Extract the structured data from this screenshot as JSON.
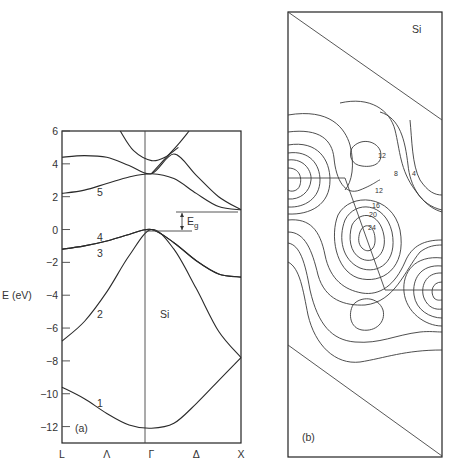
{
  "chart_data": [
    {
      "type": "line",
      "panel_label": "(a)",
      "title": "",
      "material_label": "Si",
      "ylabel": "E (eV)",
      "xlabel": "",
      "ylim": [
        -13,
        6
      ],
      "yticks": [
        6,
        4,
        2,
        0,
        -2,
        -4,
        -6,
        -8,
        -10,
        -12
      ],
      "ytick_labels": [
        "6",
        "4",
        "2",
        "0",
        "−2",
        "−4",
        "−6",
        "−8",
        "−10",
        "−12"
      ],
      "xtick_labels": [
        "L",
        "Λ",
        "Γ",
        "Δ",
        "X"
      ],
      "x_points": [
        0,
        0.5,
        1,
        1.5,
        2
      ],
      "gap_annotation": "E",
      "gap_annotation_sub": "g",
      "band_labels": [
        "1",
        "2",
        "3",
        "4",
        "5"
      ],
      "series": [
        {
          "name": "band 1",
          "x": [
            0,
            0.25,
            0.5,
            0.75,
            1,
            1.25,
            1.5,
            1.75,
            2
          ],
          "values": [
            -9.6,
            -10.3,
            -11.2,
            -11.9,
            -12.1,
            -11.8,
            -10.6,
            -9.2,
            -7.8
          ]
        },
        {
          "name": "band 2",
          "x": [
            0,
            0.25,
            0.5,
            0.75,
            1,
            1.25,
            1.5,
            1.75,
            2
          ],
          "values": [
            -6.8,
            -5.6,
            -3.8,
            -1.6,
            0,
            -1.2,
            -3.6,
            -6.2,
            -7.8
          ]
        },
        {
          "name": "band 3",
          "x": [
            0,
            0.25,
            0.5,
            0.75,
            1,
            1.25,
            1.5,
            1.75,
            2
          ],
          "values": [
            -1.2,
            -1.0,
            -0.7,
            -0.3,
            0,
            -0.8,
            -1.9,
            -2.7,
            -2.9
          ]
        },
        {
          "name": "band 4",
          "x": [
            0,
            0.25,
            0.5,
            0.75,
            1,
            1.25,
            1.5,
            1.75,
            2
          ],
          "values": [
            -1.2,
            -1.0,
            -0.7,
            -0.3,
            0,
            -0.8,
            -1.9,
            -2.7,
            -2.9
          ]
        },
        {
          "name": "band 5",
          "x": [
            0,
            0.25,
            0.5,
            0.75,
            1,
            1.25,
            1.5,
            1.75,
            2
          ],
          "values": [
            2.2,
            2.4,
            2.8,
            3.2,
            3.4,
            3.1,
            2.2,
            1.4,
            1.2
          ]
        },
        {
          "name": "band 6",
          "x": [
            0,
            0.25,
            0.5,
            0.75,
            1,
            1.25,
            1.5,
            1.75,
            2
          ],
          "values": [
            4.4,
            4.5,
            4.4,
            3.9,
            3.4,
            4.6,
            3.3,
            2.0,
            1.2
          ]
        },
        {
          "name": "band 7",
          "x": [
            0.65,
            0.8,
            1,
            1.15,
            1.3
          ],
          "values": [
            6.0,
            4.8,
            4.2,
            4.4,
            5.0
          ]
        },
        {
          "name": "band 8",
          "x": [
            1.0,
            1.15,
            1.3,
            1.42
          ],
          "values": [
            3.4,
            4.3,
            5.2,
            6.0
          ]
        }
      ],
      "band_gap_eV": 1.2
    },
    {
      "type": "heatmap",
      "panel_label": "(b)",
      "material_label": "Si",
      "description": "valence charge density contour plot",
      "contour_labels": [
        "4",
        "8",
        "12",
        "12",
        "16",
        "20",
        "24"
      ]
    }
  ]
}
